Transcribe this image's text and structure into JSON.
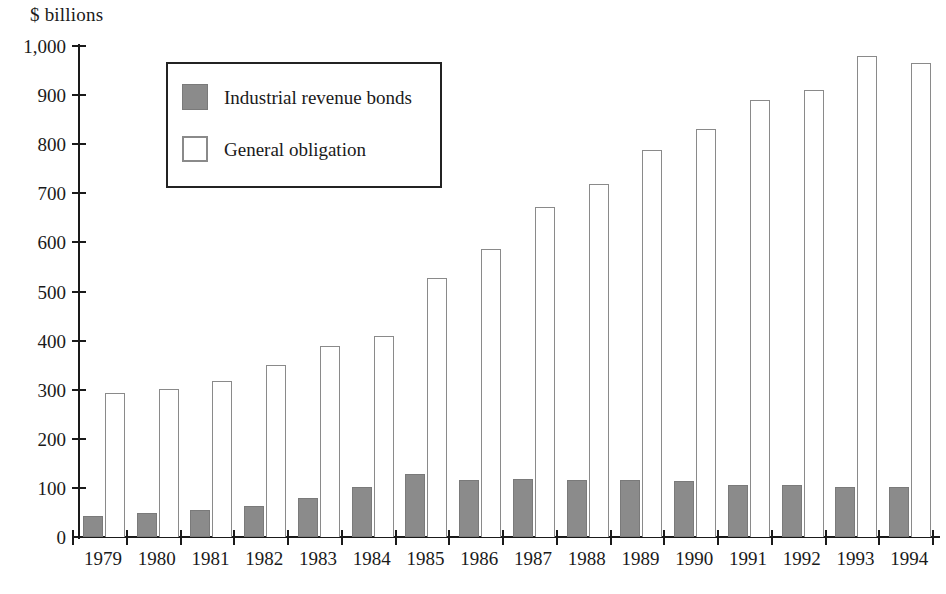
{
  "chart_data": {
    "type": "bar",
    "title": "",
    "subtitle": "",
    "xlabel": "",
    "ylabel": "$ billions",
    "ylim": [
      0,
      1000
    ],
    "y_ticks": [
      "0",
      "100",
      "200",
      "300",
      "400",
      "500",
      "600",
      "700",
      "800",
      "900",
      "1,000"
    ],
    "y_tick_values": [
      0,
      100,
      200,
      300,
      400,
      500,
      600,
      700,
      800,
      900,
      1000
    ],
    "grid": false,
    "legend_position": "upper-left-inside",
    "categories": [
      "1979",
      "1980",
      "1981",
      "1982",
      "1983",
      "1984",
      "1985",
      "1986",
      "1987",
      "1988",
      "1989",
      "1990",
      "1991",
      "1992",
      "1993",
      "1994"
    ],
    "series": [
      {
        "name": "Industrial revenue bonds",
        "color": "#8b8b8b",
        "style": "filled-gray",
        "values": [
          42,
          49,
          56,
          64,
          80,
          102,
          128,
          117,
          118,
          117,
          117,
          115,
          105,
          105,
          102,
          102
        ]
      },
      {
        "name": "General obligation",
        "color": "#ffffff",
        "style": "outlined-white",
        "values": [
          294,
          302,
          318,
          350,
          390,
          409,
          528,
          586,
          672,
          719,
          788,
          831,
          891,
          910,
          979,
          966
        ]
      }
    ]
  },
  "legend": {
    "items": [
      {
        "label": "Industrial revenue bonds",
        "swatch": "gray-filled-square"
      },
      {
        "label": "General obligation",
        "swatch": "white-outlined-square"
      }
    ]
  },
  "axis": {
    "y_title": "$ billions"
  },
  "colors": {
    "ink": "#1a1a1a",
    "series_irb": "#8b8b8b",
    "series_go": "#ffffff",
    "bar_outline": "#8a8a8a",
    "background": "#ffffff"
  }
}
